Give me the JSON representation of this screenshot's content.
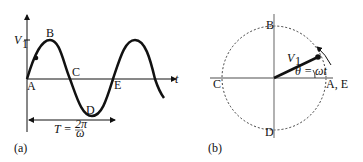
{
  "panel_a": {
    "caption": "(a)",
    "y_label": "V",
    "y_label_sub": "1",
    "x_label": "t",
    "points": [
      "A",
      "B",
      "C",
      "D",
      "E"
    ],
    "period_label_T": "T =",
    "period_num": "2π",
    "period_den": "ω"
  },
  "panel_b": {
    "caption": "(b)",
    "points": {
      "top": "B",
      "left": "C",
      "bottom": "D",
      "right": "A, E"
    },
    "vector_label": "V",
    "vector_label_sub": "1",
    "angle_label": "θ = ωt"
  }
}
